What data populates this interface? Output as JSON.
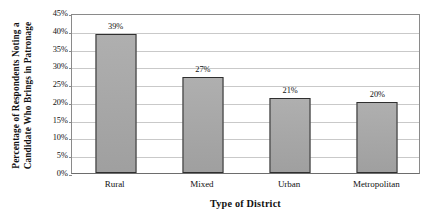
{
  "chart_data": {
    "type": "bar",
    "title": "",
    "subtitle": "",
    "xlabel": "Type of District",
    "ylabel": "Percentage of Respondents Noting a Candidate Who Brings in Patronage",
    "ylabel_lines": [
      "Percentage of Respondents Noting a",
      "Candidate Who Brings in Patronage"
    ],
    "categories": [
      "Rural",
      "Mixed",
      "Urban",
      "Metropolitan"
    ],
    "values": [
      39,
      27,
      21,
      20
    ],
    "value_labels": [
      "39%",
      "27%",
      "21%",
      "20%"
    ],
    "ylim": [
      0,
      45
    ],
    "ytick_values": [
      0,
      5,
      10,
      15,
      20,
      25,
      30,
      35,
      40,
      45
    ],
    "ytick_labels": [
      "0%",
      "5%",
      "10%",
      "15%",
      "20%",
      "25%",
      "30%",
      "35%",
      "40%",
      "45%"
    ],
    "grid": true,
    "grid_axis": "y",
    "legend": false,
    "legend_position": "none",
    "bar_fill_color": "#a6a6a6",
    "bar_border_color": "#2f2f2f",
    "gridline_color": "#c9c9c9",
    "axis_color": "#8a8a8a",
    "background_color": "#ffffff",
    "text_color": "#111111"
  }
}
